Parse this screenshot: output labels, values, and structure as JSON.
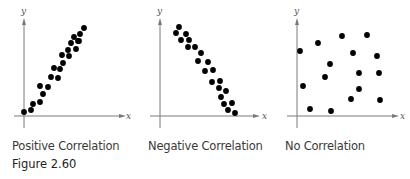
{
  "figure_label": "Figure 2.60",
  "chart_data": [
    {
      "type": "scatter",
      "title": "Positive Correlation",
      "xlabel": "x",
      "ylabel": "y",
      "grid": false,
      "points": [
        [
          24,
          112
        ],
        [
          31,
          110
        ],
        [
          33,
          104
        ],
        [
          40,
          102
        ],
        [
          40,
          86
        ],
        [
          43,
          94
        ],
        [
          48,
          87
        ],
        [
          51,
          77
        ],
        [
          54,
          68
        ],
        [
          58,
          78
        ],
        [
          60,
          69
        ],
        [
          63,
          63
        ],
        [
          62,
          55
        ],
        [
          68,
          50
        ],
        [
          69,
          56
        ],
        [
          71,
          43
        ],
        [
          74,
          37
        ],
        [
          76,
          49
        ],
        [
          78,
          41
        ],
        [
          80,
          34
        ],
        [
          79,
          41
        ],
        [
          84,
          28
        ]
      ]
    },
    {
      "type": "scatter",
      "title": "Negative Correlation",
      "xlabel": "x",
      "ylabel": "y",
      "grid": false,
      "points": [
        [
          179,
          27
        ],
        [
          176,
          33
        ],
        [
          186,
          34
        ],
        [
          181,
          40
        ],
        [
          189,
          40
        ],
        [
          188,
          47
        ],
        [
          195,
          47
        ],
        [
          201,
          53
        ],
        [
          198,
          61
        ],
        [
          208,
          62
        ],
        [
          205,
          71
        ],
        [
          213,
          70
        ],
        [
          212,
          82
        ],
        [
          220,
          81
        ],
        [
          219,
          88
        ],
        [
          226,
          91
        ],
        [
          221,
          97
        ],
        [
          224,
          104
        ],
        [
          232,
          103
        ],
        [
          228,
          110
        ],
        [
          235,
          113
        ]
      ]
    },
    {
      "type": "scatter",
      "title": "No Correlation",
      "xlabel": "x",
      "ylabel": "y",
      "grid": false,
      "points": [
        [
          300,
          51
        ],
        [
          318,
          43
        ],
        [
          342,
          36
        ],
        [
          367,
          35
        ],
        [
          353,
          53
        ],
        [
          377,
          56
        ],
        [
          330,
          64
        ],
        [
          325,
          77
        ],
        [
          359,
          73
        ],
        [
          379,
          73
        ],
        [
          303,
          86
        ],
        [
          359,
          89
        ],
        [
          351,
          99
        ],
        [
          380,
          100
        ],
        [
          310,
          109
        ],
        [
          331,
          111
        ]
      ]
    }
  ]
}
